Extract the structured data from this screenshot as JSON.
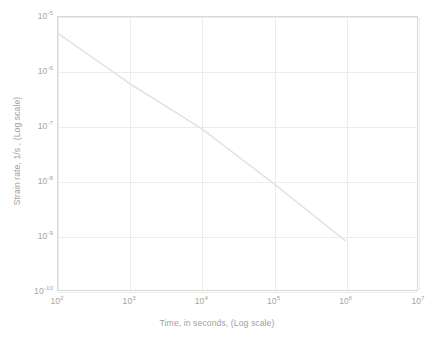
{
  "chart_data": {
    "type": "line",
    "title": "",
    "xlabel": "Time, in seconds, (Log scale)",
    "ylabel": "Strain rate,  1/s ,  (Log scale)",
    "xscale": "log",
    "yscale": "log",
    "xlim": [
      100,
      10000000
    ],
    "ylim": [
      1e-10,
      1e-05
    ],
    "grid": true,
    "legend": "none",
    "xticks": [
      {
        "value": 100,
        "base": "10",
        "exp": "2"
      },
      {
        "value": 1000,
        "base": "10",
        "exp": "3"
      },
      {
        "value": 10000,
        "base": "10",
        "exp": "4"
      },
      {
        "value": 100000,
        "base": "10",
        "exp": "5"
      },
      {
        "value": 1000000,
        "base": "10",
        "exp": "6"
      },
      {
        "value": 10000000,
        "base": "10",
        "exp": "7"
      }
    ],
    "yticks": [
      {
        "value": 1e-05,
        "base": "10",
        "exp": "-5"
      },
      {
        "value": 1e-06,
        "base": "10",
        "exp": "-6"
      },
      {
        "value": 1e-07,
        "base": "10",
        "exp": "-7"
      },
      {
        "value": 1e-08,
        "base": "10",
        "exp": "-8"
      },
      {
        "value": 1e-09,
        "base": "10",
        "exp": "-9"
      },
      {
        "value": 1e-10,
        "base": "10",
        "exp": "-10"
      }
    ],
    "series": [
      {
        "name": "strain rate vs time",
        "color": "#e3e3e3",
        "linewidth": 1.6,
        "x": [
          100,
          1000,
          10000,
          100000,
          1000000
        ],
        "y": [
          5e-06,
          6e-07,
          9e-08,
          9e-09,
          8e-10
        ]
      }
    ]
  },
  "caption": ""
}
